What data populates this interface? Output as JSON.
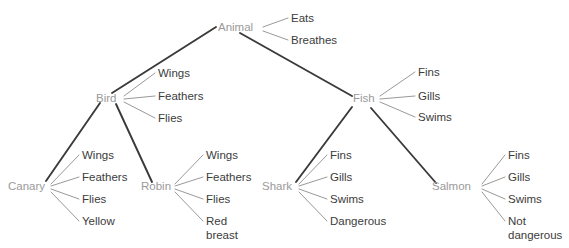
{
  "diagram": {
    "type": "semantic-network-hierarchy",
    "background_color": "#ffffff",
    "node_color": "#9a9a9a",
    "property_color": "#3c3c3c",
    "hierarchy_edge_color": "#3a3a3a",
    "property_edge_color": "#8d8d8d",
    "concepts": {
      "animal": "Animal",
      "bird": "Bird",
      "fish": "Fish",
      "canary": "Canary",
      "robin": "Robin",
      "shark": "Shark",
      "salmon": "Salmon"
    },
    "properties": {
      "animal": [
        {
          "label": "Eats"
        },
        {
          "label": "Breathes"
        }
      ],
      "bird": [
        {
          "label": "Wings"
        },
        {
          "label": "Feathers"
        },
        {
          "label": "Flies"
        }
      ],
      "fish": [
        {
          "label": "Fins"
        },
        {
          "label": "Gills"
        },
        {
          "label": "Swims"
        }
      ],
      "canary": [
        {
          "label": "Wings"
        },
        {
          "label": "Feathers"
        },
        {
          "label": "Flies"
        },
        {
          "label": "Yellow"
        }
      ],
      "robin": [
        {
          "label": "Wings"
        },
        {
          "label": "Feathers"
        },
        {
          "label": "Flies"
        },
        {
          "label": "Red"
        },
        {
          "label": "breast"
        }
      ],
      "shark": [
        {
          "label": "Fins"
        },
        {
          "label": "Gills"
        },
        {
          "label": "Swims"
        },
        {
          "label": "Dangerous"
        }
      ],
      "salmon": [
        {
          "label": "Fins"
        },
        {
          "label": "Gills"
        },
        {
          "label": "Swims"
        },
        {
          "label": "Not"
        },
        {
          "label": "dangerous"
        }
      ]
    }
  }
}
